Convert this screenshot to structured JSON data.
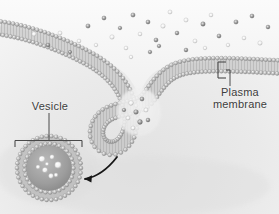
{
  "figure": {
    "width": 279,
    "height": 214,
    "style": "grayscale scientific illustration",
    "background_color": "#efefef"
  },
  "labels": {
    "vesicle": {
      "text": "Vesicle"
    },
    "plasma_membrane": {
      "line1": "Plasma",
      "line2": "membrane"
    }
  },
  "colors": {
    "membrane_head": "#b9b9b9",
    "membrane_head_light": "#e8e8e8",
    "membrane_tail": "#9a9a9a",
    "text": "#3d3d3d",
    "arrow": "#161616",
    "leader": "#4a4a4a",
    "cytoplasm": "#e6e6e6",
    "extracellular": "#f2f2f2",
    "particle_dark": "#8e8e8e",
    "particle_light": "#ffffff"
  },
  "annotations": {
    "vesicle_bracket": "horizontal bracket spanning vesicle with downward end ticks",
    "vesicle_leader": "vertical line from Vesicle text to bracket",
    "membrane_bracket": "vertical bracket spanning the bilayer thickness",
    "membrane_leader": "vertical line from bracket down to Plasma membrane text",
    "arrow": "curved arrow pointing from invagination toward the vesicle"
  },
  "chart_data": {
    "type": "diagram",
    "elements": [
      {
        "name": "plasma-membrane",
        "description": "phospholipid bilayer drawn as two rows of beads with tails"
      },
      {
        "name": "invagination-pit",
        "description": "membrane pocket engulfing extracellular particles"
      },
      {
        "name": "vesicle",
        "description": "detached spherical bilayer containing cargo particles"
      },
      {
        "name": "extracellular-particles",
        "count": 34
      },
      {
        "name": "pit-particles",
        "count": 9
      },
      {
        "name": "vesicle-cargo",
        "count": 8
      }
    ]
  }
}
